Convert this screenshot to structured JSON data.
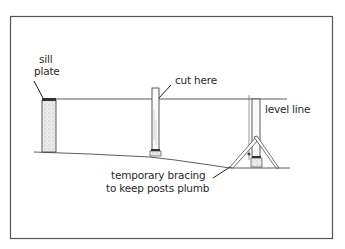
{
  "diagram": {
    "labels": {
      "sill_plate_line1": "sill",
      "sill_plate_line2": "plate",
      "cut_here": "cut here",
      "level_line": "level line",
      "bracing_line1": "temporary bracing",
      "bracing_line2": "to keep posts plumb"
    },
    "colors": {
      "ink": "#2a2a2a",
      "frame": "#555555",
      "background": "#ffffff",
      "stipple": "#bdbdbd"
    }
  }
}
